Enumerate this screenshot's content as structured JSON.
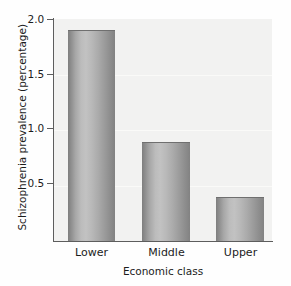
{
  "chart_data": {
    "type": "bar",
    "title": "",
    "categories": [
      "Lower",
      "Middle",
      "Upper"
    ],
    "values": [
      1.9,
      0.89,
      0.4
    ],
    "series": [
      {
        "name": "Schizophrenia prevalence",
        "values": [
          1.9,
          0.89,
          0.4
        ]
      }
    ],
    "xlabel": "Economic class",
    "ylabel": "Schizophrenia prevalence (percentage)",
    "ylim": [
      0,
      2.0
    ],
    "yticks": [
      0.5,
      1.0,
      1.5,
      2.0
    ],
    "ytick_labels": [
      "0.5",
      "1.0",
      "1.5",
      "2.0"
    ],
    "grid": true,
    "legend": false,
    "bar_color": "#b0b0b0",
    "plot_background": "#f2f2f1",
    "axis_color": "#5d5d5d"
  },
  "axes": {
    "y_title": "Schizophrenia prevalence (percentage)",
    "x_title": "Economic class",
    "ticks": [
      {
        "label": "2.0",
        "value": 2.0
      },
      {
        "label": "1.5",
        "value": 1.5
      },
      {
        "label": "1.0",
        "value": 1.0
      },
      {
        "label": "0.5",
        "value": 0.5
      }
    ]
  },
  "bars": [
    {
      "label": "Lower",
      "value": 1.9
    },
    {
      "label": "Middle",
      "value": 0.89
    },
    {
      "label": "Upper",
      "value": 0.4
    }
  ]
}
